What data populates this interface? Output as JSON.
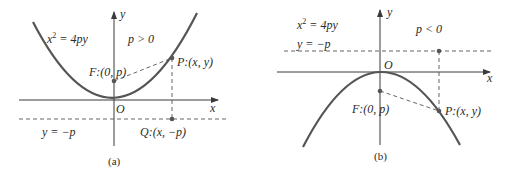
{
  "panels": [
    {
      "id": "a",
      "caption": "(a)",
      "equation_lhs": "x",
      "equation_exp": "2",
      "equation_rhs": " = 4py",
      "condition": "p > 0",
      "directrix_label": "y = −p",
      "focus_label": "F:(0, p)",
      "point_P_label": "P:(x, y)",
      "point_Q_label": "Q:(x, −p)",
      "origin_label": "O",
      "x_axis_label": "x",
      "y_axis_label": "y",
      "opens": "up"
    },
    {
      "id": "b",
      "caption": "(b)",
      "equation_lhs": "x",
      "equation_exp": "2",
      "equation_rhs": " = 4py",
      "condition": "p < 0",
      "directrix_label": "y = −p",
      "focus_label": "F:(0, p)",
      "point_P_label": "P:(x, y)",
      "origin_label": "O",
      "x_axis_label": "x",
      "y_axis_label": "y",
      "opens": "down"
    }
  ],
  "colors": {
    "curve": "#555555",
    "axis": "#3a3a3a",
    "text": "#2a2a2a",
    "background": "#ffffff"
  }
}
